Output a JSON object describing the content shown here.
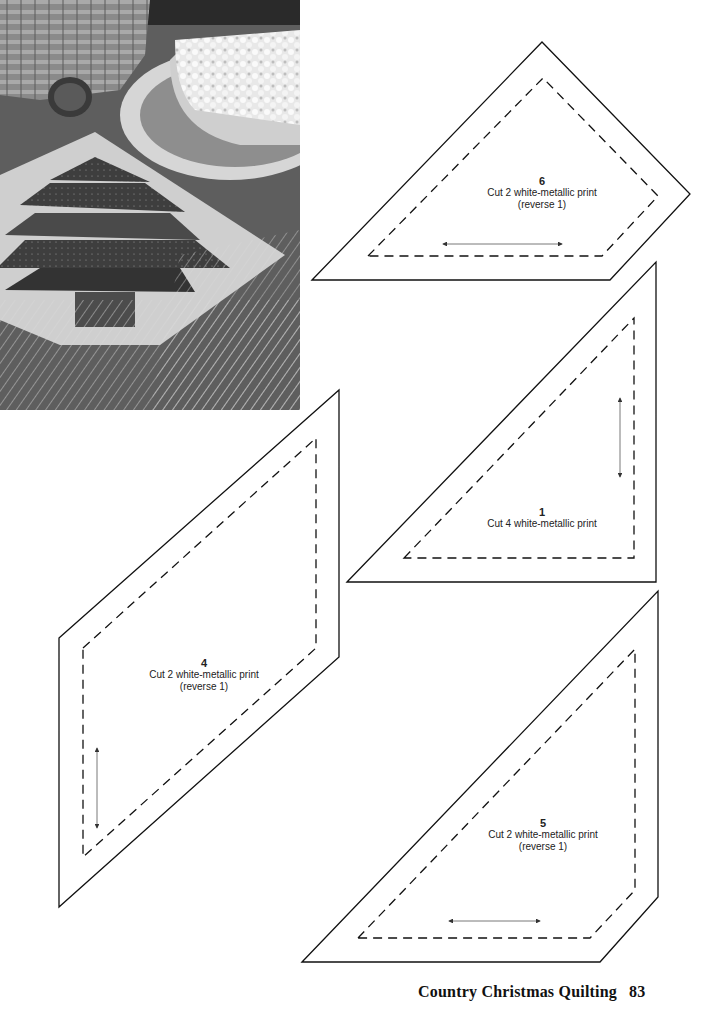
{
  "photo": {
    "description": "Black-and-white photo of a quilted Christmas tree table mat with a bowl of popcorn on a decorated plate, a woven basket, a pine cone, and pine branches"
  },
  "pieces": [
    {
      "id": "6",
      "number": "6",
      "instruction": "Cut 2 white-metallic print",
      "note": "(reverse 1)",
      "grain_arrow": "horizontal"
    },
    {
      "id": "1",
      "number": "1",
      "instruction": "Cut 4 white-metallic print",
      "note": "",
      "grain_arrow": "vertical"
    },
    {
      "id": "4",
      "number": "4",
      "instruction": "Cut 2 white-metallic print",
      "note": "(reverse 1)",
      "grain_arrow": "vertical"
    },
    {
      "id": "5",
      "number": "5",
      "instruction": "Cut 2 white-metallic print",
      "note": "(reverse 1)",
      "grain_arrow": "horizontal"
    }
  ],
  "footer": {
    "book_title": "Country Christmas Quilting",
    "page_number": "83"
  },
  "colors": {
    "line": "#111111",
    "background": "#ffffff"
  }
}
